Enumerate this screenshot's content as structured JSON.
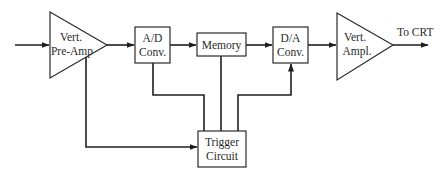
{
  "diagram": {
    "type": "block-diagram",
    "blocks": [
      {
        "id": "preamp",
        "shape": "triangle",
        "lines": [
          "Vert.",
          "Pre-Amp"
        ]
      },
      {
        "id": "adc",
        "shape": "box",
        "lines": [
          "A/D",
          "Conv."
        ]
      },
      {
        "id": "memory",
        "shape": "box",
        "lines": [
          "Memory"
        ]
      },
      {
        "id": "dac",
        "shape": "box",
        "lines": [
          "D/A",
          "Conv."
        ]
      },
      {
        "id": "ampl",
        "shape": "triangle",
        "lines": [
          "Vert.",
          "Ampl."
        ]
      },
      {
        "id": "trigger",
        "shape": "box",
        "lines": [
          "Trigger",
          "Circuit"
        ]
      }
    ],
    "output_label": "To CRT",
    "connections": [
      {
        "from": "input",
        "to": "preamp"
      },
      {
        "from": "preamp",
        "to": "adc"
      },
      {
        "from": "adc",
        "to": "memory"
      },
      {
        "from": "memory",
        "to": "dac"
      },
      {
        "from": "dac",
        "to": "ampl"
      },
      {
        "from": "ampl",
        "to": "output"
      },
      {
        "from": "preamp",
        "to": "trigger"
      },
      {
        "from": "adc",
        "to": "trigger"
      },
      {
        "from": "memory",
        "to": "trigger"
      },
      {
        "from": "trigger",
        "to": "dac"
      }
    ]
  }
}
